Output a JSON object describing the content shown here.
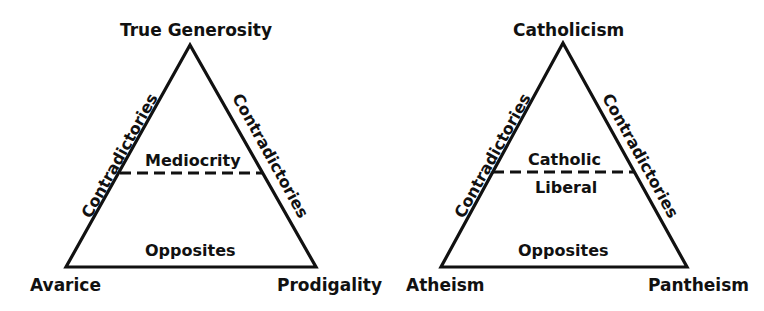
{
  "colors": {
    "line": "#111111",
    "background": "#ffffff"
  },
  "diagrams": [
    {
      "top": "True Generosity",
      "bottom_left": "Avarice",
      "bottom_right": "Prodigality",
      "left_side": "Contradictories",
      "right_side": "Contradictories",
      "base": "Opposites",
      "dashed_above": "Mediocrity",
      "dashed_below": ""
    },
    {
      "top": "Catholicism",
      "bottom_left": "Atheism",
      "bottom_right": "Pantheism",
      "left_side": "Contradictories",
      "right_side": "Contradictories",
      "base": "Opposites",
      "dashed_above": "Catholic",
      "dashed_below": "Liberal"
    }
  ]
}
